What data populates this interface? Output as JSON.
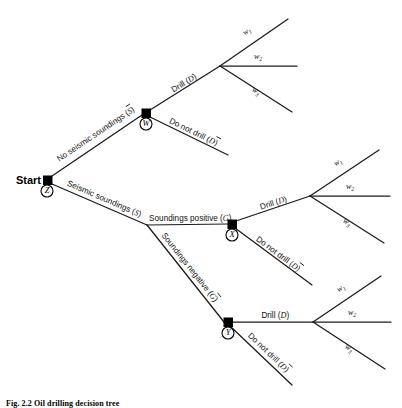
{
  "figure": {
    "type": "decision-tree",
    "caption": "Fig. 2.2  Oil drilling decision tree",
    "background": "#ffffff",
    "line_color": "#1a1a1a",
    "node_color": "#000000"
  },
  "start": {
    "label": "Start",
    "node_letter": "Z"
  },
  "nodes": [
    {
      "id": "Z",
      "letter": "Z",
      "x": 47,
      "y": 180,
      "kind": "decision"
    },
    {
      "id": "W",
      "letter": "W",
      "x": 146,
      "y": 113,
      "kind": "decision"
    },
    {
      "id": "X",
      "letter": "X",
      "x": 232,
      "y": 224,
      "kind": "decision"
    },
    {
      "id": "Y",
      "letter": "Y",
      "x": 228,
      "y": 322,
      "kind": "decision"
    }
  ],
  "branches": [
    {
      "id": "no-seismic-soundings",
      "from": "Z",
      "to": "W",
      "text_before": "No seismic soundings (",
      "variable": "S",
      "overbar": true,
      "text_after": ")"
    },
    {
      "id": "seismic-soundings",
      "from": "Z",
      "to": "split",
      "text_before": "Seismic soundings (",
      "variable": "S",
      "overbar": false,
      "text_after": ")"
    },
    {
      "id": "soundings-positive",
      "from": "split",
      "to": "X",
      "text_before": "Soundings positive (",
      "variable": "G",
      "overbar": false,
      "text_after": ")"
    },
    {
      "id": "soundings-negative",
      "from": "split",
      "to": "Y",
      "text_before": "Soundings negative (",
      "variable": "G",
      "overbar": true,
      "text_after": ")"
    },
    {
      "id": "drill-from-w",
      "from": "W",
      "to": "fan-w",
      "text_before": "Drill (",
      "variable": "D",
      "overbar": false,
      "text_after": ")"
    },
    {
      "id": "do-not-drill-from-w",
      "from": "W",
      "to": "terminal",
      "text_before": "Do not drill (",
      "variable": "D",
      "overbar": true,
      "text_after": ")"
    },
    {
      "id": "drill-from-x",
      "from": "X",
      "to": "fan-x",
      "text_before": "Drill (",
      "variable": "D",
      "overbar": false,
      "text_after": ")"
    },
    {
      "id": "do-not-drill-from-x",
      "from": "X",
      "to": "terminal",
      "text_before": "Do not drill (",
      "variable": "D",
      "overbar": true,
      "text_after": ")"
    },
    {
      "id": "drill-from-y",
      "from": "Y",
      "to": "fan-y",
      "text_before": "Drill (",
      "variable": "D",
      "overbar": false,
      "text_after": ")"
    },
    {
      "id": "do-not-drill-from-y",
      "from": "Y",
      "to": "terminal",
      "text_before": "Do not drill (",
      "variable": "D",
      "overbar": true,
      "text_after": ")"
    }
  ],
  "payoffs": {
    "symbol": "w",
    "subscripts": [
      "1",
      "2",
      "3"
    ],
    "fans": [
      {
        "id": "fan-w",
        "apex_x": 220,
        "apex_y": 66
      },
      {
        "id": "fan-x",
        "apex_x": 310,
        "apex_y": 196
      },
      {
        "id": "fan-y",
        "apex_x": 313,
        "apex_y": 322
      }
    ]
  }
}
